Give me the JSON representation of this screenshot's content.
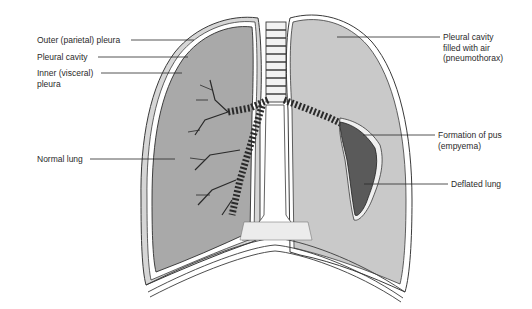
{
  "diagram": {
    "colors": {
      "normal_lung_fill": "#a9a9a9",
      "collapsed_side_fill": "#c9c9c9",
      "pleura_line": "#3a3a3a",
      "empyema_fill": "#5a5a5a",
      "background": "#ffffff"
    },
    "labels_left": [
      {
        "id": "outer-parietal-pleura",
        "text": "Outer (parietal) pleura"
      },
      {
        "id": "pleural-cavity",
        "text": "Pleural cavity"
      },
      {
        "id": "inner-visceral-pleura",
        "text": "Inner (visceral)\npleura"
      },
      {
        "id": "normal-lung",
        "text": "Normal lung"
      }
    ],
    "labels_right": [
      {
        "id": "pneumothorax",
        "text": "Pleural cavity\nfilled with air\n(pneumothorax)"
      },
      {
        "id": "empyema",
        "text": "Formation of pus\n(empyema)"
      },
      {
        "id": "deflated-lung",
        "text": "Deflated lung"
      }
    ]
  }
}
